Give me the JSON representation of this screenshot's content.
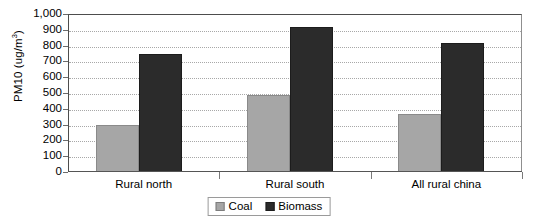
{
  "chart_data": {
    "type": "bar",
    "title": "",
    "subtitle": "",
    "xlabel": "",
    "ylabel": "PM10 (ug/m3)",
    "ylabel_base": "PM10 (ug/m",
    "ylabel_sup": "3",
    "ylabel_tail": ")",
    "categories": [
      "Rural north",
      "Rural south",
      "All rural china"
    ],
    "series": [
      {
        "name": "Coal",
        "values": [
          300,
          490,
          365
        ],
        "color": "#a6a6a6"
      },
      {
        "name": "Biomass",
        "values": [
          750,
          915,
          815
        ],
        "color": "#2b2b2b"
      }
    ],
    "ylim": [
      0,
      1000
    ],
    "ytick_values": [
      0,
      100,
      200,
      300,
      400,
      500,
      600,
      700,
      800,
      900,
      1000
    ],
    "ytick_labels": [
      "0",
      "100",
      "200",
      "300",
      "400",
      "500",
      "600",
      "700",
      "800",
      "900",
      "1,000"
    ],
    "grid": true,
    "grid_style": "dotted-horizontal",
    "legend_position": "bottom-center",
    "legend_entries": [
      "Coal",
      "Biomass"
    ]
  },
  "axis": {
    "y_title": "PM10 (ug/m3)"
  },
  "legend": {
    "coal_label": "Coal",
    "biomass_label": "Biomass"
  }
}
